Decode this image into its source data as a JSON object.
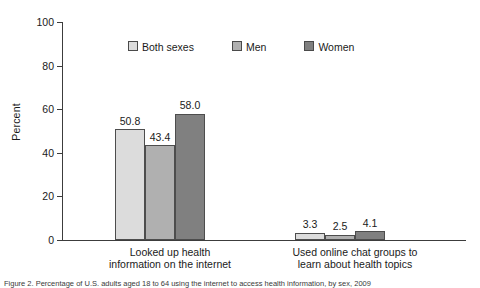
{
  "chart_data": {
    "type": "bar",
    "title": "",
    "xlabel": "",
    "ylabel": "Percent",
    "ylim": [
      0,
      100
    ],
    "yticks": [
      0,
      20,
      40,
      60,
      80,
      100
    ],
    "grid": false,
    "legend_position": "top-center",
    "categories": [
      "Looked up health\ninformation on the internet",
      "Used online chat groups to\nlearn about health topics"
    ],
    "series": [
      {
        "name": "Both sexes",
        "color": "#dcdcdc",
        "values": [
          50.8,
          3.3
        ],
        "labels": [
          "50.8",
          "3.3"
        ]
      },
      {
        "name": "Men",
        "color": "#b0b0b0",
        "values": [
          43.4,
          2.5
        ],
        "labels": [
          "43.4",
          "2.5"
        ]
      },
      {
        "name": "Women",
        "color": "#808080",
        "values": [
          58.0,
          4.1
        ],
        "labels": [
          "58.0",
          "4.1"
        ]
      }
    ]
  },
  "axis": {
    "y_title": "Percent",
    "y_tick_labels": [
      "100",
      "80",
      "60",
      "40",
      "20",
      "0"
    ]
  },
  "legend": {
    "items": [
      {
        "label": "Both sexes"
      },
      {
        "label": "Men"
      },
      {
        "label": "Women"
      }
    ]
  },
  "caption": {
    "text": "Figure 2. Percentage of U.S. adults aged 18 to 64 using the internet to access health information, by sex, 2009"
  }
}
